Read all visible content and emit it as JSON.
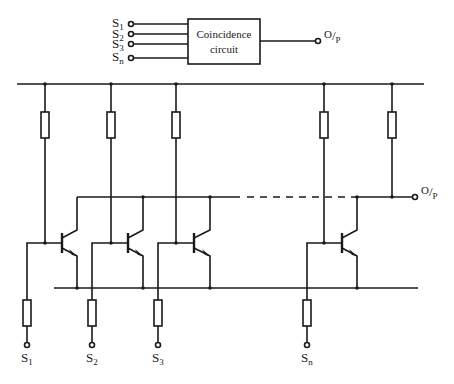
{
  "block_diagram": {
    "box_label_line1": "Coincidence",
    "box_label_line2": "circuit",
    "inputs": [
      {
        "main": "S",
        "sub": "1"
      },
      {
        "main": "S",
        "sub": "2"
      },
      {
        "main": "S",
        "sub": "3"
      },
      {
        "main": "S",
        "sub": "n"
      }
    ],
    "output": {
      "main": "O",
      "sep": "/",
      "sub": "P"
    }
  },
  "circuit": {
    "output": {
      "main": "O",
      "sep": "/",
      "sub": "P"
    },
    "inputs": [
      {
        "main": "S",
        "sub": "1"
      },
      {
        "main": "S",
        "sub": "2"
      },
      {
        "main": "S",
        "sub": "3"
      },
      {
        "main": "S",
        "sub": "n"
      }
    ],
    "stages_shown": 4,
    "stage_type": "NPN transistor with collector load resistor and base input resistor",
    "output_connection": "wired collectors with common pull-up resistor"
  },
  "colors": {
    "line": "#1a1a1a",
    "background": "#ffffff"
  }
}
